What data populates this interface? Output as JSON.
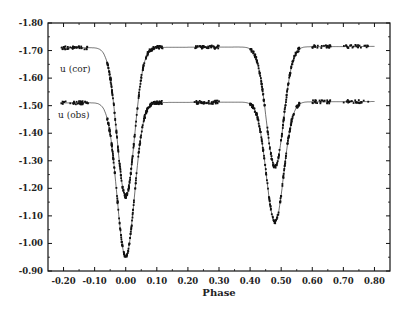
{
  "chart_data": {
    "type": "scatter",
    "title": "",
    "xlabel": "Phase",
    "ylabel": "",
    "xlim": [
      -0.25,
      0.85
    ],
    "ylim": [
      -1.8,
      -0.9
    ],
    "y_inverted": true,
    "grid": false,
    "legend": "inline labels",
    "x_ticks": [
      "-0.20",
      "-0.10",
      "0.00",
      "0.10",
      "0.20",
      "0.30",
      "0.40",
      "0.50",
      "0.60",
      "0.70",
      "0.80"
    ],
    "y_ticks": [
      "-1.80",
      "-1.70",
      "-1.60",
      "-1.50",
      "-1.40",
      "-1.30",
      "-1.20",
      "-1.10",
      "-1.00",
      "-0.90"
    ],
    "series": [
      {
        "name": "u (cor)",
        "style": "points + model line",
        "out_of_eclipse": -1.71,
        "primary_min": {
          "phase": 0.0,
          "value": -1.17
        },
        "secondary_min": {
          "phase": 0.48,
          "value": -1.275
        },
        "x": [
          -0.2,
          -0.15,
          -0.1,
          -0.06,
          -0.04,
          -0.02,
          0.0,
          0.02,
          0.04,
          0.06,
          0.1,
          0.2,
          0.3,
          0.4,
          0.43,
          0.45,
          0.48,
          0.51,
          0.53,
          0.56,
          0.6,
          0.7,
          0.8
        ],
        "values": [
          -1.715,
          -1.712,
          -1.705,
          -1.68,
          -1.5,
          -1.3,
          -1.17,
          -1.3,
          -1.5,
          -1.69,
          -1.705,
          -1.715,
          -1.715,
          -1.71,
          -1.6,
          -1.42,
          -1.275,
          -1.42,
          -1.6,
          -1.7,
          -1.705,
          -1.715,
          -1.715
        ]
      },
      {
        "name": "u (obs)",
        "style": "points + model line",
        "out_of_eclipse": -1.51,
        "primary_min": {
          "phase": 0.0,
          "value": -0.95
        },
        "secondary_min": {
          "phase": 0.48,
          "value": -1.075
        },
        "x": [
          -0.2,
          -0.15,
          -0.1,
          -0.06,
          -0.04,
          -0.02,
          0.0,
          0.02,
          0.04,
          0.06,
          0.1,
          0.2,
          0.3,
          0.4,
          0.43,
          0.45,
          0.48,
          0.51,
          0.53,
          0.56,
          0.6,
          0.7,
          0.8
        ],
        "values": [
          -1.515,
          -1.512,
          -1.505,
          -1.48,
          -1.29,
          -1.08,
          -0.95,
          -1.08,
          -1.29,
          -1.49,
          -1.505,
          -1.515,
          -1.515,
          -1.51,
          -1.4,
          -1.22,
          -1.075,
          -1.22,
          -1.4,
          -1.5,
          -1.505,
          -1.512,
          -1.515
        ]
      }
    ]
  },
  "labels": {
    "x_axis": "Phase",
    "series_cor": "u (cor)",
    "series_obs": "u (obs)"
  }
}
